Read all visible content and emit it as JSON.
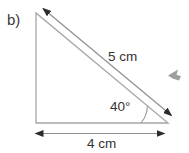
{
  "figure": {
    "part_label": "b)",
    "hypotenuse_label": "5 cm",
    "angle_label": "40°",
    "base_label": "4 cm"
  },
  "colors": {
    "background": "#ffffff",
    "triangle_stroke": "#a6a6a6",
    "dimension_stroke": "#8f8f8f",
    "arrowhead": "#2b2b2b",
    "arc_stroke": "#9a9a9a",
    "text": "#333333",
    "cursor": "#9e9e9e"
  }
}
